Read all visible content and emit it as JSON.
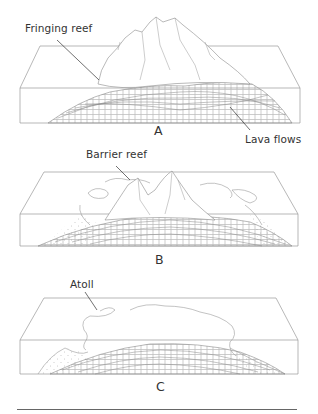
{
  "figure": {
    "panels": [
      {
        "id": "A",
        "letter": "A",
        "stage": "Fringing reef",
        "labels": {
          "top": "Fringing reef",
          "bottom": "Lava flows"
        }
      },
      {
        "id": "B",
        "letter": "B",
        "stage": "Barrier reef",
        "labels": {
          "top": "Barrier reef"
        }
      },
      {
        "id": "C",
        "letter": "C",
        "stage": "Atoll",
        "labels": {
          "top": "Atoll"
        }
      }
    ],
    "colors": {
      "line": "#8a8a8a",
      "text": "#333333",
      "rule": "#666666",
      "background": "#ffffff"
    }
  }
}
